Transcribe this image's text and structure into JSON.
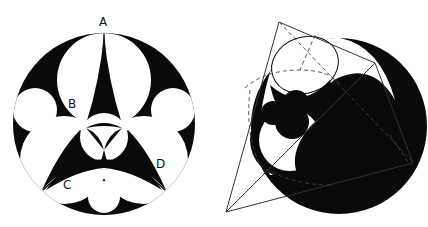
{
  "figures": {
    "left": {
      "description": "Circle packing inside a circle with three-fold symmetry, black and white",
      "labels": {
        "a": "A",
        "b": "B",
        "c": "C",
        "d": "D"
      },
      "colors": {
        "fill": "#0a0a0a",
        "background": "#ffffff"
      }
    },
    "right": {
      "description": "Sphere inscribed in a tetrahedron with nested circle packing and dashed construction lines",
      "colors": {
        "fill": "#0a0a0a",
        "line": "#333333",
        "background": "#ffffff"
      }
    }
  }
}
